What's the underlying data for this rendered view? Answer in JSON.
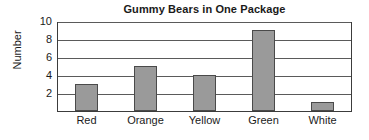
{
  "chart_data": {
    "type": "bar",
    "title": "Gummy Bears in One Package",
    "xlabel": "",
    "ylabel": "Number",
    "categories": [
      "Red",
      "Orange",
      "Yellow",
      "Green",
      "White"
    ],
    "values": [
      3,
      5,
      4,
      9,
      1
    ],
    "ylim": [
      0,
      10
    ],
    "yticks": [
      2,
      4,
      6,
      8,
      10
    ],
    "ytick_labels": [
      "2",
      "4",
      "6",
      "8",
      "10"
    ],
    "grid": true,
    "grid_axis": "y",
    "legend": false,
    "legend_position": "none",
    "bar_color": "#9a9a9a",
    "bar_edge_color": "#4a4a4a",
    "frame_color": "#3c3c3c",
    "background_color": "#ffffff",
    "text_color": "#1a1a1a"
  }
}
